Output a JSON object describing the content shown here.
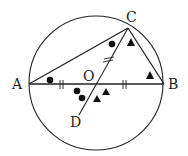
{
  "diagram": {
    "type": "geometry",
    "colors": {
      "stroke": "#222222",
      "background": "#ffffff"
    },
    "circle": {
      "center_label": "O",
      "cx": 96,
      "cy": 83,
      "r": 67
    },
    "points": {
      "A": {
        "label": "A",
        "x": 29,
        "y": 84
      },
      "B": {
        "label": "B",
        "x": 164,
        "y": 84
      },
      "C": {
        "label": "C",
        "x": 128,
        "y": 28
      },
      "D": {
        "label": "D",
        "x": 79,
        "y": 115
      },
      "O": {
        "label": "O",
        "x": 96,
        "y": 84
      }
    },
    "segments": [
      "AB",
      "AC",
      "BC",
      "CD"
    ],
    "tick_marks": [
      {
        "segment": "AO",
        "count": 2
      },
      {
        "segment": "OB",
        "count": 2
      },
      {
        "segment": "OC",
        "count": 2
      }
    ],
    "angle_markers": [
      {
        "at": "A",
        "symbol": "circle",
        "count": 1
      },
      {
        "at": "C (angle ACO)",
        "symbol": "circle",
        "count": 1
      },
      {
        "at": "O (angle AOD)",
        "symbol": "circle",
        "count": 2
      },
      {
        "at": "C (angle OCB)",
        "symbol": "triangle",
        "count": 1
      },
      {
        "at": "B",
        "symbol": "triangle",
        "count": 1
      },
      {
        "at": "O (angle DOB)",
        "symbol": "triangle",
        "count": 2
      }
    ]
  }
}
